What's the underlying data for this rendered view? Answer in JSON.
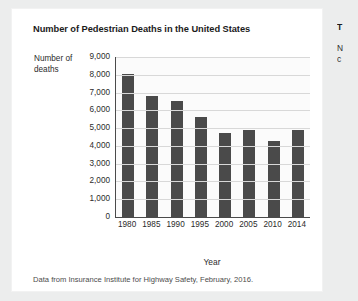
{
  "figure": {
    "title": "Number of Pedestrian Deaths in the United States",
    "source_note": "Data from Insurance Institute for Highway Safety, February, 2016.",
    "bar_color": "#4a4a4a",
    "card_background": "#ffffff",
    "page_background": "#eceded"
  },
  "side_column": {
    "heading": "T",
    "line1": "N",
    "line2": "c"
  },
  "chart_data": {
    "type": "bar",
    "title": "Number of Pedestrian Deaths in the United States",
    "categories": [
      "1980",
      "1985",
      "1990",
      "1995",
      "2000",
      "2005",
      "2010",
      "2014"
    ],
    "values": [
      8050,
      6800,
      6500,
      5600,
      4750,
      4900,
      4300,
      4900
    ],
    "xlabel": "Year",
    "ylabel": "Number of deaths",
    "ylim": [
      0,
      9000
    ],
    "ytick_labels": [
      "9,000",
      "8,000",
      "7,000",
      "6,000",
      "5,000",
      "4,000",
      "3,000",
      "2,000",
      "1,000",
      "0"
    ],
    "ytick_values": [
      9000,
      8000,
      7000,
      6000,
      5000,
      4000,
      3000,
      2000,
      1000,
      0
    ],
    "grid": true,
    "legend": "none"
  }
}
